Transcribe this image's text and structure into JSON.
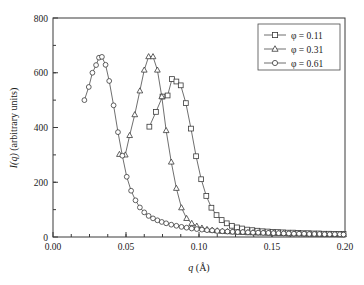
{
  "chart_data": {
    "type": "line",
    "title": "",
    "xlabel": "q (Å)",
    "xlabel_symbol": "q",
    "xlabel_unit": "(Å)",
    "ylabel": "I(q) (arbitrary units)",
    "ylabel_symbol": "I(q)",
    "ylabel_unit": "(arbitrary units)",
    "xlim": [
      0.0,
      0.2
    ],
    "ylim": [
      0,
      800
    ],
    "xticks": [
      0.0,
      0.05,
      0.1,
      0.15,
      0.2
    ],
    "xticklabels": [
      "0.00",
      "0.05",
      "0.10",
      "0.15",
      "0.20"
    ],
    "yticks": [
      0,
      200,
      400,
      600,
      800
    ],
    "yticklabels": [
      "0",
      "200",
      "400",
      "600",
      "800"
    ],
    "x_minor_tick_step": 0.0125,
    "y_minor_tick_step": 100,
    "grid": false,
    "legend_position": "top-right",
    "series": [
      {
        "name": "φ = 0.11",
        "legend_label": "φ = 0.11",
        "marker": "square",
        "x": [
          0.066,
          0.0705,
          0.075,
          0.0785,
          0.0815,
          0.0845,
          0.0875,
          0.091,
          0.0945,
          0.098,
          0.1015,
          0.105,
          0.1085,
          0.112,
          0.1155,
          0.119,
          0.1225,
          0.126,
          0.1295,
          0.133,
          0.1365,
          0.14,
          0.1435,
          0.147,
          0.1505,
          0.154,
          0.1575,
          0.161,
          0.1645,
          0.168,
          0.1715,
          0.175,
          0.1785,
          0.182,
          0.1855,
          0.189,
          0.1925,
          0.196,
          0.199
        ],
        "y": [
          403,
          457,
          513,
          517,
          577,
          568,
          554,
          489,
          396,
          295,
          211,
          150,
          107,
          80,
          62,
          50,
          41,
          35,
          31,
          27,
          25,
          23,
          21,
          20,
          19,
          18,
          17,
          16,
          16,
          15,
          14,
          14,
          13,
          13,
          12,
          12,
          11,
          11,
          11
        ]
      },
      {
        "name": "φ = 0.31",
        "legend_label": "φ = 0.31",
        "marker": "triangle",
        "x": [
          0.0455,
          0.0495,
          0.0525,
          0.056,
          0.0595,
          0.0625,
          0.0655,
          0.0685,
          0.0715,
          0.0745,
          0.0775,
          0.081,
          0.0845,
          0.088,
          0.0915,
          0.095,
          0.0985,
          0.102,
          0.1055,
          0.109,
          0.1125,
          0.116,
          0.1195,
          0.123,
          0.1265,
          0.13,
          0.1335,
          0.137,
          0.1405,
          0.144,
          0.1475,
          0.151,
          0.1545,
          0.158,
          0.1615,
          0.165,
          0.1685,
          0.172,
          0.1755,
          0.179,
          0.1825,
          0.186,
          0.1895,
          0.193,
          0.1965,
          0.199
        ],
        "y": [
          302,
          300,
          371,
          447,
          534,
          610,
          659,
          659,
          610,
          513,
          389,
          274,
          178,
          107,
          68,
          50,
          40,
          33,
          28,
          25,
          23,
          21,
          20,
          19,
          18,
          17,
          16,
          16,
          15,
          15,
          14,
          14,
          13,
          13,
          12,
          12,
          12,
          11,
          11,
          11,
          10,
          10,
          10,
          10,
          9,
          9
        ]
      },
      {
        "name": "φ = 0.61",
        "legend_label": "φ = 0.61",
        "marker": "circle",
        "x": [
          0.0215,
          0.0245,
          0.027,
          0.0295,
          0.0315,
          0.0335,
          0.036,
          0.0385,
          0.0415,
          0.0445,
          0.0475,
          0.0505,
          0.0535,
          0.0565,
          0.0595,
          0.0625,
          0.0655,
          0.0685,
          0.0715,
          0.0745,
          0.0775,
          0.081,
          0.0845,
          0.088,
          0.0915,
          0.095,
          0.0985,
          0.102,
          0.1055,
          0.109,
          0.1125,
          0.116,
          0.1195,
          0.123,
          0.1265,
          0.13,
          0.1335,
          0.137,
          0.1405,
          0.144,
          0.1475,
          0.151,
          0.1545,
          0.158,
          0.1615,
          0.165,
          0.1685,
          0.172,
          0.1755,
          0.179,
          0.1825,
          0.186,
          0.1895,
          0.193,
          0.1965,
          0.199
        ],
        "y": [
          500,
          548,
          600,
          628,
          655,
          658,
          629,
          570,
          481,
          383,
          297,
          220,
          169,
          134,
          108,
          90,
          77,
          68,
          61,
          55,
          50,
          45,
          41,
          37,
          34,
          31,
          29,
          27,
          25,
          24,
          22,
          21,
          20,
          19,
          18,
          18,
          17,
          16,
          16,
          15,
          15,
          14,
          14,
          13,
          13,
          12,
          12,
          12,
          11,
          11,
          11,
          10,
          10,
          10,
          10,
          9
        ]
      }
    ]
  },
  "axes": {
    "x_axis_name": "q-axis",
    "y_axis_name": "intensity-axis"
  }
}
